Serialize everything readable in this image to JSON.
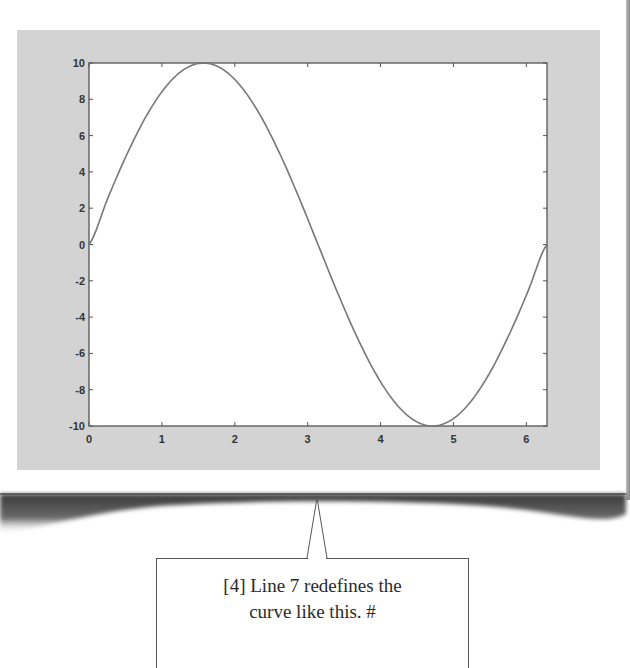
{
  "chart_data": {
    "type": "line",
    "title": "",
    "xlabel": "",
    "ylabel": "",
    "xlim": [
      0,
      6.2832
    ],
    "ylim": [
      -10,
      10
    ],
    "grid": false,
    "legend": null,
    "x_ticks": [
      "0",
      "1",
      "2",
      "3",
      "4",
      "5",
      "6"
    ],
    "y_ticks": [
      "10",
      "8",
      "6",
      "4",
      "2",
      "0",
      "-2",
      "-4",
      "-6",
      "-8",
      "-10"
    ],
    "series": [
      {
        "name": "10*sin(x)",
        "x": [
          0,
          0.2618,
          0.5236,
          0.7854,
          1.0472,
          1.309,
          1.5708,
          1.8326,
          2.0944,
          2.3562,
          2.618,
          2.8798,
          3.1416,
          3.4034,
          3.6652,
          3.927,
          4.1888,
          4.4506,
          4.7124,
          4.9742,
          5.236,
          5.4978,
          5.7596,
          6.0214,
          6.2832
        ],
        "values": [
          0,
          2.59,
          5.0,
          7.07,
          8.66,
          9.66,
          10.0,
          9.66,
          8.66,
          7.07,
          5.0,
          2.59,
          0,
          -2.59,
          -5.0,
          -7.07,
          -8.66,
          -9.66,
          -10.0,
          -9.66,
          -8.66,
          -7.07,
          -5.0,
          -2.59,
          0
        ]
      }
    ],
    "colors": {
      "line": "#777777",
      "axes": "#555555",
      "panel": "#d3d3d3",
      "plot_bg": "#ffffff"
    }
  },
  "callout": {
    "line1": "[4] Line 7 redefines the",
    "line2": "curve like this.  #"
  }
}
